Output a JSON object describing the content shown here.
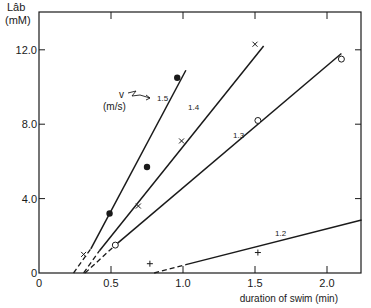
{
  "chart_data": {
    "type": "scatter",
    "title": "",
    "xlabel": "duration of swim (min)",
    "ylabel": "Lâb",
    "ylabel_unit": "(mM)",
    "xlim": [
      0,
      2.24
    ],
    "ylim": [
      0,
      13.2
    ],
    "x_ticks": [
      0,
      0.5,
      1.0,
      1.5,
      2.0
    ],
    "x_tick_labels": [
      "0",
      "0.5",
      "1.0",
      "1.5",
      "2.0"
    ],
    "y_ticks": [
      0,
      4.0,
      8.0,
      12.0
    ],
    "y_tick_labels": [
      "0",
      "4.0",
      "8.0",
      "12.0"
    ],
    "grid": false,
    "legend_annotation": {
      "text": "v",
      "unit": "(m/s)",
      "points_to": "1.5"
    },
    "series": [
      {
        "name": "1.5",
        "marker": "filled-circle",
        "points": [
          [
            0.49,
            3.2
          ],
          [
            0.75,
            5.7
          ],
          [
            0.96,
            10.5
          ]
        ],
        "fit_line": {
          "x0_intercept": 0.24,
          "solid_from": [
            0.36,
            1.3
          ],
          "solid_to": [
            1.02,
            10.9
          ]
        }
      },
      {
        "name": "1.4",
        "marker": "x",
        "points": [
          [
            0.31,
            1.0
          ],
          [
            0.69,
            3.6
          ],
          [
            0.99,
            7.1
          ],
          [
            1.5,
            12.3
          ]
        ],
        "fit_line": {
          "x0_intercept": 0.31,
          "solid_from": [
            0.42,
            1.2
          ],
          "solid_to": [
            1.56,
            12.2
          ]
        }
      },
      {
        "name": "1.3",
        "marker": "open-circle",
        "points": [
          [
            0.53,
            1.5
          ],
          [
            1.52,
            8.2
          ],
          [
            2.1,
            11.5
          ]
        ],
        "fit_line": {
          "x0_intercept": 0.32,
          "solid_from": [
            0.53,
            1.5
          ],
          "solid_to": [
            2.1,
            11.8
          ]
        }
      },
      {
        "name": "1.2",
        "marker": "plus",
        "points": [
          [
            0.77,
            0.5
          ],
          [
            1.52,
            1.1
          ]
        ],
        "fit_line": {
          "x0_intercept": 0.8,
          "solid_from": [
            1.02,
            0.45
          ],
          "solid_to": [
            2.24,
            2.85
          ]
        }
      }
    ]
  }
}
